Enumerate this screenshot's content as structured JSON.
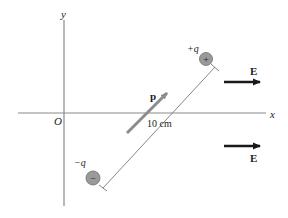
{
  "diagram": {
    "axes": {
      "x_label": "x",
      "y_label": "y",
      "origin_label": "O"
    },
    "dipole": {
      "moment_label": "p",
      "separation_label": "10 cm",
      "positive_charge": {
        "label": "+q",
        "symbol": "+"
      },
      "negative_charge": {
        "label": "−q",
        "symbol": "−"
      }
    },
    "field": {
      "label": "E",
      "arrow_count": 2
    },
    "colors": {
      "axis": "#8a8a8a",
      "charge_fill": "#9a9a9a",
      "charge_stroke": "#6e6e6e",
      "moment_arrow": "#8c8c8c",
      "field_arrow": "#1a1a1a",
      "dimension_line": "#777777"
    }
  }
}
